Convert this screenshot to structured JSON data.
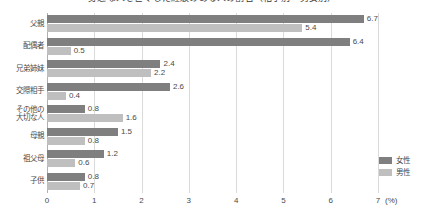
{
  "chart_data": {
    "type": "bar",
    "orientation": "horizontal",
    "title": "身近な人を亡くした経験のある人の割合（相手別・男女別）",
    "xlabel": "(%)",
    "ylabel": "",
    "xlim": [
      0,
      7
    ],
    "xticks": [
      0,
      1,
      2,
      3,
      4,
      5,
      6,
      7
    ],
    "xtick_labels": [
      "0",
      "1",
      "2",
      "3",
      "4",
      "5",
      "6",
      "7"
    ],
    "unit_label": "(%)",
    "grid": true,
    "legend_position": "bottom-right",
    "categories": [
      "父親",
      "配偶者",
      "兄弟姉妹",
      "交際相手",
      "その他の\n大切な人",
      "母親",
      "祖父母",
      "子供"
    ],
    "series": [
      {
        "name": "女性",
        "color": "#7f7f7f",
        "values": [
          6.7,
          6.4,
          2.4,
          2.6,
          0.8,
          1.5,
          1.2,
          0.8
        ]
      },
      {
        "name": "男性",
        "color": "#bfbfbf",
        "values": [
          5.4,
          0.5,
          2.2,
          0.4,
          1.6,
          0.8,
          0.6,
          0.7
        ]
      }
    ]
  },
  "legend": {
    "items": [
      {
        "label": "女性",
        "color": "#7f7f7f"
      },
      {
        "label": "男性",
        "color": "#bfbfbf"
      }
    ]
  }
}
